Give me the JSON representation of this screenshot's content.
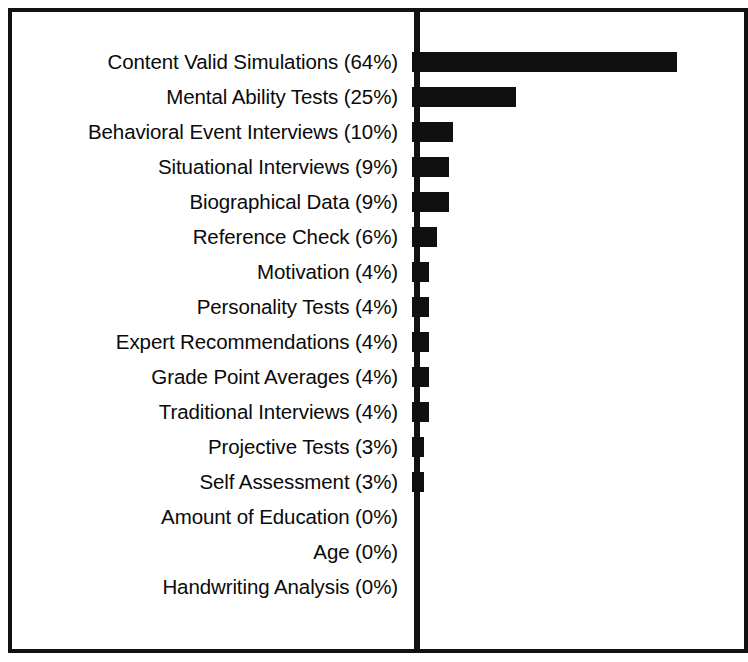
{
  "chart_data": {
    "type": "bar",
    "orientation": "horizontal",
    "title": "",
    "subtitle": "",
    "xlabel": "",
    "ylabel": "",
    "xlim": [
      0,
      70
    ],
    "grid": false,
    "legend": null,
    "bar_color": "#101010",
    "axis_color": "#111111",
    "background_color": "#ffffff",
    "value_unit": "%",
    "categories": [
      "Content Valid Simulations",
      "Mental Ability Tests",
      "Behavioral Event Interviews",
      "Situational Interviews",
      "Biographical Data",
      "Reference Check",
      "Motivation",
      "Personality Tests",
      "Expert Recommendations",
      "Grade Point Averages",
      "Traditional Interviews",
      "Projective Tests",
      "Self Assessment",
      "Amount of Education",
      "Age",
      "Handwriting Analysis"
    ],
    "values": [
      64,
      25,
      10,
      9,
      9,
      6,
      4,
      4,
      4,
      4,
      4,
      3,
      3,
      0,
      0,
      0
    ],
    "tick_labels": [
      "Content Valid Simulations (64%)",
      "Mental Ability Tests (25%)",
      "Behavioral Event Interviews (10%)",
      "Situational Interviews (9%)",
      "Biographical Data (9%)",
      "Reference Check (6%)",
      "Motivation (4%)",
      "Personality Tests (4%)",
      "Expert Recommendations (4%)",
      "Grade Point Averages (4%)",
      "Traditional Interviews (4%)",
      "Projective Tests (3%)",
      "Self Assessment (3%)",
      "Amount of Education (0%)",
      "Age (0%)",
      "Handwriting Analysis (0%)"
    ]
  },
  "layout": {
    "row_height": 35,
    "first_row_top": 44,
    "px_per_percent": 4.14,
    "min_bar_px": 0
  }
}
